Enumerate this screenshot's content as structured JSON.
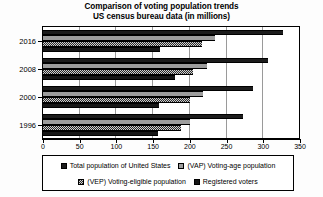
{
  "chart": {
    "title_line1": "Comparison of voting population trends",
    "title_line2": "US census bureau data (in millions)"
  },
  "legend": {
    "items": [
      {
        "label": "Total population of United States",
        "swatch": "solid-dark-swatch"
      },
      {
        "label": "(VAP) Voting-age population",
        "swatch": "light-gray-swatch"
      },
      {
        "label": "(VEP) Voting-eligible population",
        "swatch": "checkered-swatch"
      },
      {
        "label": "Registered voters",
        "swatch": "solid-black-swatch"
      }
    ]
  },
  "axis": {
    "x_ticks": [
      "0",
      "50",
      "100",
      "150",
      "200",
      "250",
      "300",
      "350"
    ],
    "y_ticks": [
      "2016",
      "2008",
      "2000",
      "1996"
    ]
  },
  "chart_data": {
    "type": "bar",
    "orientation": "horizontal",
    "xlabel": "",
    "ylabel": "",
    "xlim": [
      0,
      350
    ],
    "grid": true,
    "legend_position": "bottom",
    "categories": [
      "2016",
      "2008",
      "2000",
      "1996"
    ],
    "series": [
      {
        "name": "Total population of United States",
        "values": [
          327,
          306,
          286,
          272
        ],
        "color": "#1c1c1c"
      },
      {
        "name": "(VAP) Voting-age population",
        "values": [
          234,
          223,
          218,
          200
        ],
        "color": "#9d9d9d"
      },
      {
        "name": "(VEP) Voting-eligible population",
        "values": [
          217,
          204,
          200,
          188
        ],
        "color": "#2a2a2a"
      },
      {
        "name": "Registered voters",
        "values": [
          159,
          180,
          158,
          157
        ],
        "color": "#161616"
      }
    ]
  }
}
